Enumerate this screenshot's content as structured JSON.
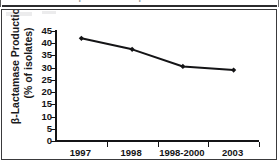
{
  "figure": {
    "clipped_caption": "FIG. 1. β-Lactamase production",
    "frame_style": "bordered-table-cell"
  },
  "chart_data": {
    "type": "line",
    "title": "",
    "xlabel": "",
    "ylabel": "β-Lactamase Production (% of isolates)",
    "ylabel_line1": "β-Lactamase Production",
    "ylabel_line2": "(% of isolates)",
    "categories": [
      "1997",
      "1998",
      "1998-2000",
      "2003"
    ],
    "values": [
      42,
      37.5,
      30.5,
      29
    ],
    "series": [
      {
        "name": "β-Lactamase Production",
        "values": [
          42,
          37.5,
          30.5,
          29
        ]
      }
    ],
    "ylim": [
      0,
      45
    ],
    "ytick_values": [
      "45",
      "40",
      "35",
      "30",
      "25",
      "20",
      "15",
      "10",
      "5",
      "0"
    ],
    "ytick_numbers": [
      45,
      40,
      35,
      30,
      25,
      20,
      15,
      10,
      5,
      0
    ],
    "ytick_step": 5,
    "grid": false,
    "legend": false,
    "legend_position": "none",
    "marker": "diamond",
    "line_color": "#141416",
    "marker_color": "#141416",
    "background_color": "#ffffff"
  }
}
